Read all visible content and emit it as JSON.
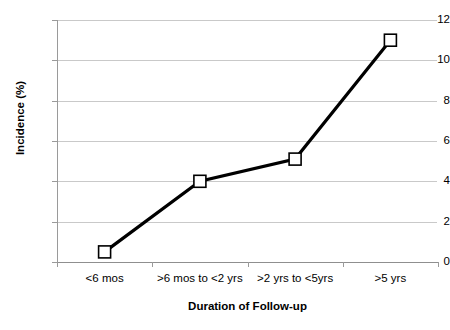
{
  "chart_data": {
    "type": "line",
    "title": "",
    "xlabel": "Duration of Follow-up",
    "ylabel": "Incidence (%)",
    "categories": [
      "<6 mos",
      ">6 mos to <2 yrs",
      ">2 yrs to <5yrs",
      ">5 yrs"
    ],
    "values": [
      0.5,
      4.0,
      5.1,
      11.0
    ],
    "series": [
      {
        "name": "Incidence",
        "values": [
          0.5,
          4.0,
          5.1,
          11.0
        ]
      }
    ],
    "ylim": [
      0,
      12
    ],
    "ytick_labels": [
      "0",
      "2",
      "4",
      "6",
      "8",
      "10",
      "12"
    ],
    "ytick_values": [
      0,
      2,
      4,
      6,
      8,
      10,
      12
    ],
    "grid": "horizontal",
    "legend": "none",
    "colors": {
      "line": "#000000",
      "marker_fill": "#ffffff",
      "marker_stroke": "#000000",
      "gridline": "#c9c9c9",
      "axis": "#8f8f8f",
      "background": "#ffffff",
      "text": "#000000"
    }
  }
}
